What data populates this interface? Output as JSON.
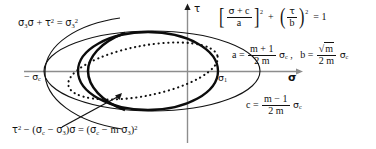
{
  "figure": {
    "background": "#ffffff",
    "ink": "#111111",
    "axis_color": "#8a8a8a"
  },
  "axes": {
    "x_label": "σ",
    "y_label": "τ",
    "x_axis_y": 71,
    "y_axis_x": 187,
    "x_start": 24,
    "x_end": 300,
    "y_start": 6,
    "y_end": 143
  },
  "labels": {
    "tau_axis": "τ",
    "sigma_axis": "σ",
    "sigma_1": "σ",
    "sigma_1_sub": "1",
    "neg_sigma_c": "− σ",
    "neg_sigma_c_sub": "c"
  },
  "equations": {
    "top_left": {
      "name": "parabolic-envelope-equation",
      "text": "σ₃σ + τ² = σ₃²",
      "parts": {
        "sigma": "σ",
        "sub3": "3",
        "tau": "τ",
        "sup2": "2",
        "equals": "="
      }
    },
    "ellipse": {
      "name": "ellipse-standard-form",
      "text": "[(σ + c)/a]² + [τ/b]² = 1",
      "numerator1": "σ + c",
      "denominator1": "a",
      "numerator2": "τ",
      "denominator2": "b",
      "exponent": "2",
      "plus": "+",
      "equals": "=",
      "rhs": "1"
    },
    "a_b": {
      "name": "semi-axis-definitions",
      "a_lhs": "a =",
      "a_num": "m + 1",
      "a_den": "2 m",
      "a_factor": "σ",
      "a_factor_sub": "c",
      "comma": ",",
      "b_lhs": "b =",
      "b_num": "√m",
      "b_den": "2 m",
      "b_factor": "σ",
      "b_factor_sub": "c"
    },
    "c": {
      "name": "center-offset-definition",
      "lhs": "c =",
      "num": "m − 1",
      "den": "2 m",
      "factor": "σ",
      "factor_sub": "c"
    },
    "bottom": {
      "name": "modified-envelope-equation",
      "text": "τ² − (σc − σ₃)σ = (σc − m σ₃)²",
      "tau": "τ",
      "sup2": "2",
      "minus": "−",
      "sigma": "σ",
      "sub_c": "c",
      "sub_3": "3",
      "equals": "=",
      "m": "m"
    }
  },
  "curves": [
    {
      "name": "thin-ellipse",
      "style": "solid-thin",
      "description": "large shallow ellipse spanning left to right",
      "cx": 152,
      "cy": 71,
      "rx": 108,
      "ry": 40,
      "rotation": 0,
      "stroke": "#111111",
      "stroke_width": 1.1
    },
    {
      "name": "bold-ellipse-arc",
      "style": "solid-bold",
      "description": "bold ellipse with right vertex at sigma-1",
      "cx": 148,
      "cy": 71,
      "rx": 70,
      "ry": 39,
      "rotation": 0,
      "stroke": "#111111",
      "stroke_width": 2.3
    },
    {
      "name": "dotted-ellipse",
      "style": "dotted",
      "description": "tilted dotted ellipse through the intersection points",
      "cx": 143,
      "cy": 71,
      "rx": 74,
      "ry": 25,
      "rotation": -12,
      "stroke": "#111111",
      "stroke_width": 2.0
    },
    {
      "name": "left-arc",
      "style": "solid-thin",
      "description": "left parabolic arc opening right",
      "stroke": "#111111",
      "stroke_width": 1.1
    }
  ],
  "leader": {
    "name": "leader-arrow",
    "description": "arrow from bottom equation to bold envelope curve",
    "from_x": 62,
    "from_y": 126,
    "to_x": 125,
    "to_y": 92
  },
  "intersections": {
    "top": {
      "x": 125,
      "y": 33
    },
    "bottom": {
      "x": 125,
      "y": 110
    },
    "right_vertex": {
      "x": 218,
      "y": 71
    }
  }
}
